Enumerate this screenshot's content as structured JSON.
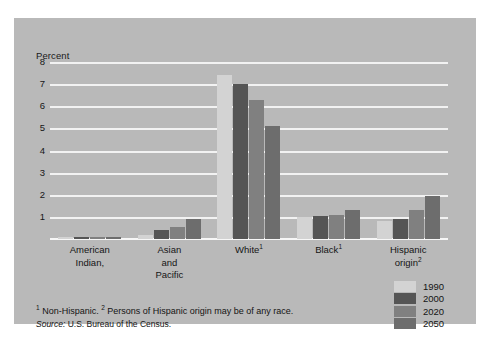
{
  "figure": {
    "background_color": "#b9b9b9",
    "page_background": "#ffffff"
  },
  "axis": {
    "ylabel": "Percent",
    "tick_labels": [
      "8",
      "7",
      "6",
      "5",
      "4",
      "3",
      "2",
      "1"
    ]
  },
  "notes": {
    "footnote_marker_1": "1",
    "footnote_text_1": " Non-Hispanic. ",
    "footnote_marker_2": "2",
    "footnote_text_2": " Persons of Hispanic origin may be of any race.",
    "source_word": "Source:",
    "source_text": " U.S. Bureau of the Census."
  },
  "legend": {
    "items": [
      {
        "label": "1990",
        "color": "#d3d3d3"
      },
      {
        "label": "2000",
        "color": "#555555"
      },
      {
        "label": "2020",
        "color": "#808080"
      },
      {
        "label": "2050",
        "color": "#6d6d6d"
      }
    ]
  },
  "categories_display": [
    {
      "line1": "American",
      "line2": "Indian,",
      "line3": "",
      "sup": ""
    },
    {
      "line1": "Asian",
      "line2": "and",
      "line3": "Pacific",
      "sup": ""
    },
    {
      "line1": "White",
      "line2": "",
      "line3": "",
      "sup": "1"
    },
    {
      "line1": "Black",
      "line2": "",
      "line3": "",
      "sup": "1"
    },
    {
      "line1": "Hispanic",
      "line2": "origin",
      "line3": "",
      "sup": "2"
    }
  ],
  "chart_data": {
    "type": "bar",
    "title": "",
    "xlabel": "",
    "ylabel": "Percent",
    "ylim": [
      0,
      8
    ],
    "yticks": [
      1,
      2,
      3,
      4,
      5,
      6,
      7,
      8
    ],
    "grid": true,
    "legend_position": "bottom-right",
    "categories": [
      "American Indian,",
      "Asian and Pacific",
      "White (Non-Hispanic)",
      "Black (Non-Hispanic)",
      "Hispanic origin"
    ],
    "series": [
      {
        "name": "1990",
        "color": "#d3d3d3",
        "values": [
          0.07,
          0.2,
          7.4,
          1.0,
          0.8
        ]
      },
      {
        "name": "2000",
        "color": "#555555",
        "values": [
          0.07,
          0.4,
          7.0,
          1.05,
          0.9
        ]
      },
      {
        "name": "2020",
        "color": "#808080",
        "values": [
          0.07,
          0.55,
          6.3,
          1.1,
          1.3
        ]
      },
      {
        "name": "2050",
        "color": "#6d6d6d",
        "values": [
          0.07,
          0.9,
          5.1,
          1.3,
          1.95
        ]
      }
    ]
  }
}
